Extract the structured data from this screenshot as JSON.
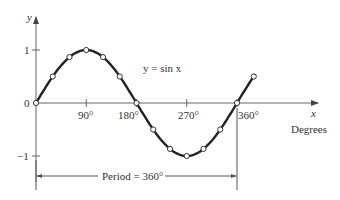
{
  "chart_data": {
    "type": "line",
    "title": "",
    "curve_label": "y = sin x",
    "xlabel": "x",
    "xunit_label": "Degrees",
    "ylabel": "y",
    "x_ticks": [
      "90°",
      "180°",
      "270°",
      "360°"
    ],
    "y_ticks": [
      "1",
      "0",
      "−1"
    ],
    "xlim": [
      0,
      400
    ],
    "ylim": [
      -1.2,
      1.4
    ],
    "annotation": "Period =  360°",
    "series": [
      {
        "name": "y = sin x",
        "x": [
          0,
          30,
          60,
          90,
          120,
          150,
          180,
          210,
          240,
          270,
          300,
          330,
          360,
          390
        ],
        "values": [
          0,
          0.5,
          0.866,
          1,
          0.866,
          0.5,
          0,
          -0.5,
          -0.866,
          -1,
          -0.866,
          -0.5,
          0,
          0.5
        ]
      }
    ],
    "curve_extends_to_deg": 420,
    "grid": false
  },
  "colors": {
    "curve": "#222222",
    "axis": "#555555",
    "marker_fill": "#ffffff"
  }
}
